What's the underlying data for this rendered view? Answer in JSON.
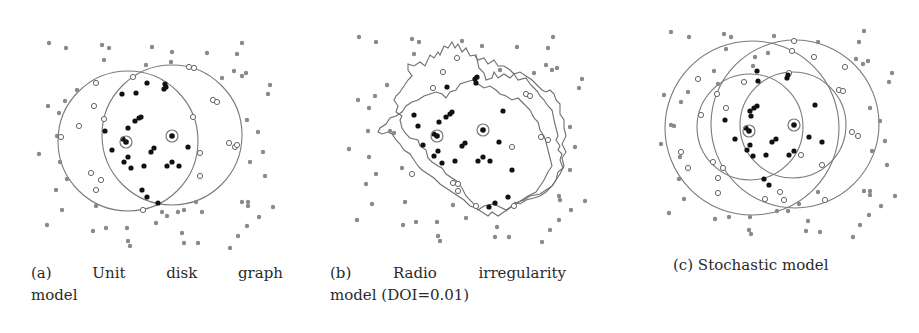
{
  "figure": {
    "colors": {
      "background": "#ffffff",
      "gray_node": "#8a8a8a",
      "black_node": "#111111",
      "ring": "#7a7a7a",
      "open_node_stroke": "#666666"
    },
    "legend_semantics": {
      "gray_dot": "node outside range",
      "black_dot": "node connected",
      "open_circle": "node in boundary region",
      "ringed_dot": "transmitter / anchor node"
    },
    "panels": [
      {
        "id": "a",
        "caption_words": [
          "(a)",
          "Unit",
          "disk",
          "graph"
        ],
        "caption_line2": "model",
        "caption_full": "(a) Unit disk graph model",
        "shape": "two circles",
        "anchors": [
          [
            126,
            142
          ],
          [
            172,
            136
          ]
        ],
        "circles": [
          {
            "cx": 128,
            "cy": 141,
            "r": 69
          },
          {
            "cx": 172,
            "cy": 135,
            "r": 69
          }
        ]
      },
      {
        "id": "b",
        "caption_words": [
          "(b)",
          "Radio",
          "irregularity"
        ],
        "caption_line2": "model (DOI=0.01)",
        "caption_full": "(b) Radio irregularity model (DOI=0.01)",
        "shape": "two irregular boundaries",
        "anchors": [
          [
            437,
            136
          ],
          [
            483,
            129
          ]
        ]
      },
      {
        "id": "c",
        "caption_words": [
          "(c) Stochastic model"
        ],
        "caption_line2": "",
        "caption_full": "(c) Stochastic model",
        "shape": "four circles (inner and outer ranges)",
        "anchors": [
          [
            749,
            130
          ],
          [
            794,
            125
          ]
        ],
        "circles": [
          {
            "cx": 749,
            "cy": 127,
            "r": 53
          },
          {
            "cx": 794,
            "cy": 125,
            "r": 53
          },
          {
            "cx": 752,
            "cy": 127,
            "r": 85
          },
          {
            "cx": 794,
            "cy": 124,
            "r": 85
          }
        ]
      }
    ]
  }
}
